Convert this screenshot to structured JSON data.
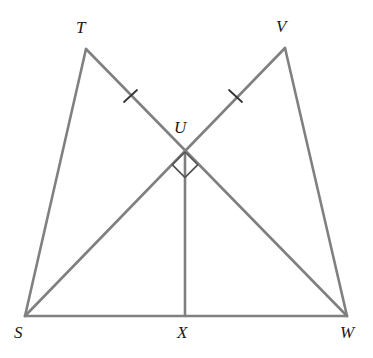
{
  "figure": {
    "kind": "geometry-diagram",
    "width": 373,
    "height": 358,
    "background_color": "#ffffff",
    "stroke_color": "#808080",
    "mark_color": "#333333",
    "label_color": "#1a1a1a",
    "stroke_width": 2.6
  },
  "points": {
    "S": {
      "label": "S",
      "x": 25,
      "y": 316,
      "label_x": 14,
      "label_y": 324
    },
    "T": {
      "label": "T",
      "x": 86,
      "y": 49,
      "label_x": 76,
      "label_y": 19
    },
    "U": {
      "label": "U",
      "x": 185,
      "y": 152,
      "label_x": 174,
      "label_y": 119
    },
    "V": {
      "label": "V",
      "x": 285,
      "y": 48,
      "label_x": 276,
      "label_y": 18
    },
    "W": {
      "label": "W",
      "x": 347,
      "y": 316,
      "label_x": 340,
      "label_y": 324
    },
    "X": {
      "label": "X",
      "x": 185,
      "y": 316,
      "label_x": 177,
      "label_y": 324
    }
  },
  "segments": [
    {
      "name": "segment-ST",
      "from": "S",
      "to": "T",
      "x1": 25,
      "y1": 316,
      "x2": 86,
      "y2": 49
    },
    {
      "name": "segment-TW",
      "from": "T",
      "to": "W",
      "x1": 86,
      "y1": 49,
      "x2": 347,
      "y2": 316
    },
    {
      "name": "segment-SV",
      "from": "S",
      "to": "V",
      "x1": 25,
      "y1": 316,
      "x2": 285,
      "y2": 48
    },
    {
      "name": "segment-VW",
      "from": "V",
      "to": "W",
      "x1": 285,
      "y1": 48,
      "x2": 347,
      "y2": 316
    },
    {
      "name": "segment-SW",
      "from": "S",
      "to": "W",
      "x1": 25,
      "y1": 316,
      "x2": 347,
      "y2": 316
    },
    {
      "name": "segment-UX",
      "from": "U",
      "to": "X",
      "x1": 185,
      "y1": 152,
      "x2": 185,
      "y2": 316
    }
  ],
  "tick_marks": [
    {
      "name": "tick-mark-TU",
      "on_segment": "segment-TW",
      "cx": 130,
      "cy": 96,
      "x1": 124,
      "y1": 102,
      "x2": 137,
      "y2": 90
    },
    {
      "name": "tick-mark-VU",
      "on_segment": "segment-SV",
      "cx": 235,
      "cy": 96,
      "x1": 229,
      "y1": 90,
      "x2": 242,
      "y2": 102
    }
  ],
  "right_angle_marks": [
    {
      "name": "right-angle-mark-left",
      "at_point": "U",
      "points": "185,152 167,152 167,170 185,170"
    },
    {
      "name": "right-angle-mark-right",
      "at_point": "U",
      "points": "185,152 203,152 203,170 185,170"
    }
  ]
}
